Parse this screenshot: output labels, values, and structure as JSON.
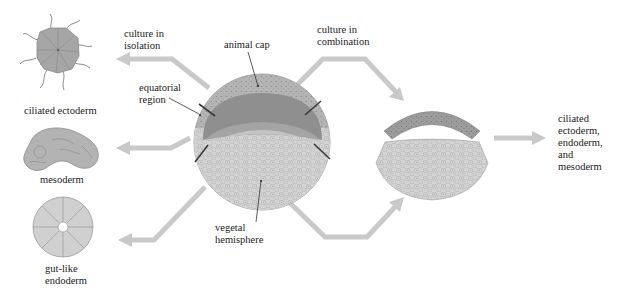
{
  "labels": {
    "culture_isolation": [
      "culture in",
      "isolation"
    ],
    "culture_combination": [
      "culture in",
      "combination"
    ],
    "animal_cap": "animal cap",
    "equatorial_region": [
      "equatorial",
      "region"
    ],
    "vegetal_hemisphere": [
      "vegetal",
      "hemisphere"
    ],
    "ciliated_ectoderm": "ciliated ectoderm",
    "mesoderm": "mesoderm",
    "gut_like_endoderm": [
      "gut-like",
      "endoderm"
    ],
    "result": [
      "ciliated",
      "ectoderm,",
      "endoderm,",
      "and",
      "mesoderm"
    ]
  },
  "colors": {
    "arrow": "#c9c9c9",
    "outer_ring": "#b4b4b4",
    "animal_cap": "#8c8c8c",
    "equatorial": "#a3a3a3",
    "vegetal": "#d2d2d2",
    "ectoderm_cell": "#a6a6a6",
    "mesoderm_cell": "#b3b3b3",
    "endoderm_cell": "#d0d0d0",
    "outline": "#8a8a8a",
    "text": "#222222"
  }
}
